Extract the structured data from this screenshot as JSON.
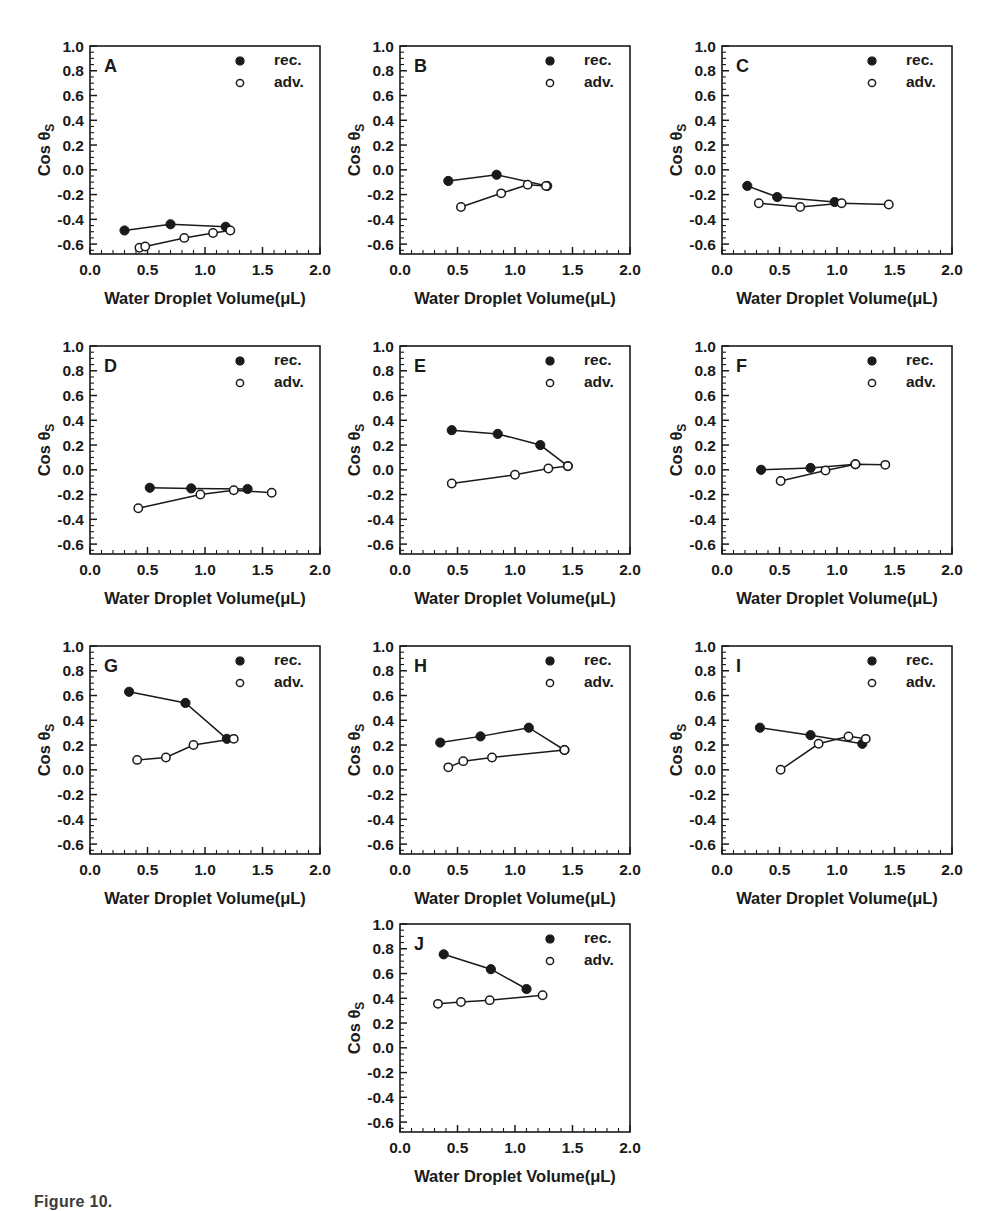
{
  "figure": {
    "caption_fragment": "Figure 10.",
    "axis": {
      "xlabel_main": "Water Droplet Volume(",
      "xlabel_unit": "μL",
      "xlabel_close": ")",
      "ylabel_main": "Cos θ",
      "ylabel_sub": "S",
      "xticks": [
        "0.0",
        "0.5",
        "1.0",
        "1.5",
        "2.0"
      ],
      "yticks": [
        "1.0",
        "0.8",
        "0.6",
        "0.4",
        "0.2",
        "0.0",
        "-0.2",
        "-0.4",
        "-0.6"
      ],
      "xlim": [
        0.0,
        2.0
      ],
      "ylim": [
        -0.68,
        1.0
      ],
      "x_minor_per_major": 5,
      "y_minor_per_major": 4,
      "grid": false
    },
    "legend": {
      "position": "top-right inside axes",
      "entries": [
        {
          "marker": "filled-circle",
          "label": "rec."
        },
        {
          "marker": "open-circle",
          "label": "adv."
        }
      ]
    },
    "colors": {
      "ink": "#1a1a1a",
      "background": "#ffffff",
      "marker_fill_open": "#ffffff"
    }
  },
  "chart_data": [
    {
      "type": "line",
      "panel": "A",
      "title": "A",
      "xlabel": "Water Droplet Volume(μL)",
      "ylabel": "Cos θS",
      "xlim": [
        0.0,
        2.0
      ],
      "ylim": [
        -0.68,
        1.0
      ],
      "series": [
        {
          "name": "rec.",
          "marker": "filled-circle",
          "x": [
            0.3,
            0.7,
            1.18
          ],
          "y": [
            -0.49,
            -0.44,
            -0.46
          ]
        },
        {
          "name": "adv.",
          "marker": "open-circle",
          "x": [
            0.43,
            0.48,
            0.82,
            1.07,
            1.22
          ],
          "y": [
            -0.63,
            -0.62,
            -0.55,
            -0.51,
            -0.49
          ]
        }
      ]
    },
    {
      "type": "line",
      "panel": "B",
      "title": "B",
      "xlabel": "Water Droplet Volume(μL)",
      "ylabel": "Cos θS",
      "xlim": [
        0.0,
        2.0
      ],
      "ylim": [
        -0.68,
        1.0
      ],
      "series": [
        {
          "name": "rec.",
          "marker": "filled-circle",
          "x": [
            0.42,
            0.84,
            1.28
          ],
          "y": [
            -0.09,
            -0.04,
            -0.13
          ]
        },
        {
          "name": "adv.",
          "marker": "open-circle",
          "x": [
            0.53,
            0.88,
            1.11,
            1.27
          ],
          "y": [
            -0.3,
            -0.19,
            -0.12,
            -0.13
          ]
        }
      ]
    },
    {
      "type": "line",
      "panel": "C",
      "title": "C",
      "xlabel": "Water Droplet Volume(μL)",
      "ylabel": "Cos θS",
      "xlim": [
        0.0,
        2.0
      ],
      "ylim": [
        -0.68,
        1.0
      ],
      "series": [
        {
          "name": "rec.",
          "marker": "filled-circle",
          "x": [
            0.22,
            0.48,
            0.98
          ],
          "y": [
            -0.13,
            -0.22,
            -0.26
          ]
        },
        {
          "name": "adv.",
          "marker": "open-circle",
          "x": [
            0.32,
            0.68,
            1.04,
            1.45
          ],
          "y": [
            -0.27,
            -0.3,
            -0.27,
            -0.28
          ]
        }
      ]
    },
    {
      "type": "line",
      "panel": "D",
      "title": "D",
      "xlabel": "Water Droplet Volume(μL)",
      "ylabel": "Cos θS",
      "xlim": [
        0.0,
        2.0
      ],
      "ylim": [
        -0.68,
        1.0
      ],
      "series": [
        {
          "name": "rec.",
          "marker": "filled-circle",
          "x": [
            0.52,
            0.88,
            1.37
          ],
          "y": [
            -0.145,
            -0.15,
            -0.155
          ]
        },
        {
          "name": "adv.",
          "marker": "open-circle",
          "x": [
            0.42,
            0.96,
            1.25,
            1.58
          ],
          "y": [
            -0.31,
            -0.2,
            -0.165,
            -0.185
          ]
        }
      ]
    },
    {
      "type": "line",
      "panel": "E",
      "title": "E",
      "xlabel": "Water Droplet Volume(μL)",
      "ylabel": "Cos θS",
      "xlim": [
        0.0,
        2.0
      ],
      "ylim": [
        -0.68,
        1.0
      ],
      "series": [
        {
          "name": "rec.",
          "marker": "filled-circle",
          "x": [
            0.45,
            0.85,
            1.22,
            1.46
          ],
          "y": [
            0.32,
            0.29,
            0.2,
            0.03
          ]
        },
        {
          "name": "adv.",
          "marker": "open-circle",
          "x": [
            0.45,
            1.0,
            1.29,
            1.46
          ],
          "y": [
            -0.11,
            -0.04,
            0.01,
            0.03
          ]
        }
      ]
    },
    {
      "type": "line",
      "panel": "F",
      "title": "F",
      "xlabel": "Water Droplet Volume(μL)",
      "ylabel": "Cos θS",
      "xlim": [
        0.0,
        2.0
      ],
      "ylim": [
        -0.68,
        1.0
      ],
      "series": [
        {
          "name": "rec.",
          "marker": "filled-circle",
          "x": [
            0.34,
            0.77,
            1.16
          ],
          "y": [
            0.0,
            0.015,
            0.045
          ]
        },
        {
          "name": "adv.",
          "marker": "open-circle",
          "x": [
            0.51,
            0.9,
            1.16,
            1.42
          ],
          "y": [
            -0.09,
            -0.005,
            0.045,
            0.04
          ]
        }
      ]
    },
    {
      "type": "line",
      "panel": "G",
      "title": "G",
      "xlabel": "Water Droplet Volume(μL)",
      "ylabel": "Cos θS",
      "xlim": [
        0.0,
        2.0
      ],
      "ylim": [
        -0.68,
        1.0
      ],
      "series": [
        {
          "name": "rec.",
          "marker": "filled-circle",
          "x": [
            0.34,
            0.83,
            1.19
          ],
          "y": [
            0.63,
            0.54,
            0.25
          ]
        },
        {
          "name": "adv.",
          "marker": "open-circle",
          "x": [
            0.41,
            0.66,
            0.9,
            1.25
          ],
          "y": [
            0.08,
            0.1,
            0.2,
            0.25
          ]
        }
      ]
    },
    {
      "type": "line",
      "panel": "H",
      "title": "H",
      "xlabel": "Water Droplet Volume(μL)",
      "ylabel": "Cos θS",
      "xlim": [
        0.0,
        2.0
      ],
      "ylim": [
        -0.68,
        1.0
      ],
      "series": [
        {
          "name": "rec.",
          "marker": "filled-circle",
          "x": [
            0.35,
            0.7,
            1.12,
            1.43
          ],
          "y": [
            0.22,
            0.27,
            0.34,
            0.16
          ]
        },
        {
          "name": "adv.",
          "marker": "open-circle",
          "x": [
            0.42,
            0.55,
            0.8,
            1.43
          ],
          "y": [
            0.02,
            0.07,
            0.1,
            0.16
          ]
        }
      ]
    },
    {
      "type": "line",
      "panel": "I",
      "title": "I",
      "xlabel": "Water Droplet Volume(μL)",
      "ylabel": "Cos θS",
      "xlim": [
        0.0,
        2.0
      ],
      "ylim": [
        -0.68,
        1.0
      ],
      "series": [
        {
          "name": "rec.",
          "marker": "filled-circle",
          "x": [
            0.33,
            0.77,
            1.22
          ],
          "y": [
            0.34,
            0.28,
            0.21
          ]
        },
        {
          "name": "adv.",
          "marker": "open-circle",
          "x": [
            0.51,
            0.84,
            1.1,
            1.25
          ],
          "y": [
            0.0,
            0.21,
            0.27,
            0.25
          ]
        }
      ]
    },
    {
      "type": "line",
      "panel": "J",
      "title": "J",
      "xlabel": "Water Droplet Volume(μL)",
      "ylabel": "Cos θS",
      "xlim": [
        0.0,
        2.0
      ],
      "ylim": [
        -0.68,
        1.0
      ],
      "series": [
        {
          "name": "rec.",
          "marker": "filled-circle",
          "x": [
            0.38,
            0.79,
            1.1
          ],
          "y": [
            0.755,
            0.635,
            0.475
          ]
        },
        {
          "name": "adv.",
          "marker": "open-circle",
          "x": [
            0.33,
            0.53,
            0.78,
            1.24
          ],
          "y": [
            0.355,
            0.37,
            0.385,
            0.425
          ]
        }
      ]
    }
  ],
  "layout": {
    "panel_positions": [
      {
        "panel": "A",
        "left": 28,
        "top": 22
      },
      {
        "panel": "B",
        "left": 338,
        "top": 22
      },
      {
        "panel": "C",
        "left": 660,
        "top": 22
      },
      {
        "panel": "D",
        "left": 28,
        "top": 322
      },
      {
        "panel": "E",
        "left": 338,
        "top": 322
      },
      {
        "panel": "F",
        "left": 660,
        "top": 322
      },
      {
        "panel": "G",
        "left": 28,
        "top": 622
      },
      {
        "panel": "H",
        "left": 338,
        "top": 622
      },
      {
        "panel": "I",
        "left": 660,
        "top": 622
      },
      {
        "panel": "J",
        "left": 338,
        "top": 900
      }
    ]
  }
}
